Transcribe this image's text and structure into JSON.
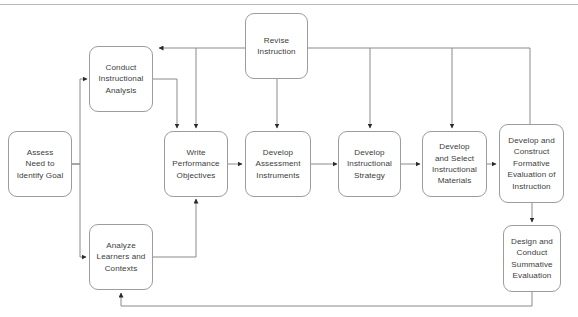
{
  "diagram": {
    "type": "flowchart",
    "background_color": "#ffffff",
    "box_border_color": "#9c9c9c",
    "connector_color": "#7a7a7a",
    "text_color": "#3c3c3c",
    "nodes": [
      {
        "id": "assess-need",
        "label": "Assess\nNeed to\nIdentify Goal"
      },
      {
        "id": "conduct-analysis",
        "label": "Conduct\nInstructional\nAnalysis"
      },
      {
        "id": "analyze-learners",
        "label": "Analyze\nLearners and\nContexts"
      },
      {
        "id": "write-objectives",
        "label": "Write\nPerformance\nObjectives"
      },
      {
        "id": "develop-assessment",
        "label": "Develop\nAssessment\nInstruments"
      },
      {
        "id": "develop-strategy",
        "label": "Develop\nInstructional\nStrategy"
      },
      {
        "id": "develop-materials",
        "label": "Develop\nand Select\nInstructional\nMaterials"
      },
      {
        "id": "formative-evaluation",
        "label": "Develop and\nConstruct\nFormative\nEvaluation of\nInstruction"
      },
      {
        "id": "summative-evaluation",
        "label": "Design and\nConduct\nSummative\nEvaluation"
      },
      {
        "id": "revise-instruction",
        "label": "Revise\nInstruction"
      }
    ],
    "edges": [
      {
        "from": "assess-need",
        "to": "conduct-analysis"
      },
      {
        "from": "assess-need",
        "to": "analyze-learners"
      },
      {
        "from": "conduct-analysis",
        "to": "write-objectives"
      },
      {
        "from": "analyze-learners",
        "to": "write-objectives"
      },
      {
        "from": "write-objectives",
        "to": "develop-assessment"
      },
      {
        "from": "develop-assessment",
        "to": "develop-strategy"
      },
      {
        "from": "develop-strategy",
        "to": "develop-materials"
      },
      {
        "from": "develop-materials",
        "to": "formative-evaluation"
      },
      {
        "from": "formative-evaluation",
        "to": "summative-evaluation"
      },
      {
        "from": "revise-instruction",
        "to": "conduct-analysis"
      },
      {
        "from": "revise-instruction",
        "to": "write-objectives"
      },
      {
        "from": "revise-instruction",
        "to": "develop-assessment"
      },
      {
        "from": "revise-instruction",
        "to": "develop-strategy"
      },
      {
        "from": "revise-instruction",
        "to": "develop-materials"
      },
      {
        "from": "revise-instruction",
        "to": "formative-evaluation"
      },
      {
        "from": "formative-evaluation",
        "to": "revise-instruction"
      },
      {
        "from": "summative-evaluation",
        "to": "analyze-learners"
      }
    ]
  }
}
